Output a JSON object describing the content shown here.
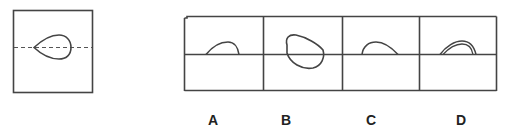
{
  "question": {
    "reference_figure": {
      "description": "square with horizontal dashed line and teardrop shape pointing left, centered on the line",
      "fold_line": "dashed"
    },
    "options": [
      {
        "label": "A",
        "shape": "half-teardrop arc above line"
      },
      {
        "label": "B",
        "shape": "closed rounded teardrop crossing line"
      },
      {
        "label": "C",
        "shape": "half-teardrop arc above line"
      },
      {
        "label": "D",
        "shape": "double-outline half-teardrop arc above line"
      }
    ]
  },
  "colors": {
    "stroke": "#444444",
    "background": "#ffffff"
  }
}
